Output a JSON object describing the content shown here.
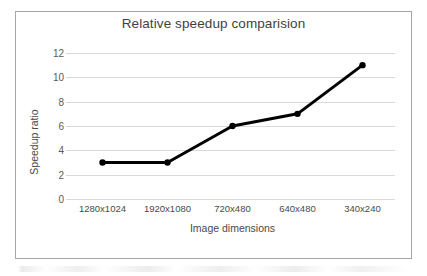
{
  "chart_data": {
    "type": "line",
    "title": "Relative speedup comparision",
    "xlabel": "Image dimensions",
    "ylabel": "Speedup ratio",
    "categories": [
      "1280x1024",
      "1920x1080",
      "720x480",
      "640x480",
      "340x240"
    ],
    "values": [
      3,
      3,
      6,
      7,
      11
    ],
    "series": [
      {
        "name": "Speedup ratio",
        "values": [
          3,
          3,
          6,
          7,
          11
        ]
      }
    ],
    "ylim": [
      0,
      12
    ],
    "y_ticks": [
      0,
      2,
      4,
      6,
      8,
      10,
      12
    ],
    "y_tick_labels": [
      "0",
      "2",
      "4",
      "6",
      "8",
      "10",
      "12"
    ],
    "grid": "horizontal",
    "legend": "none",
    "marker": "circle",
    "line_color": "#000000",
    "marker_color": "#000000",
    "gridline_color": "#d9d9d9",
    "plot_background": "#ffffff",
    "border_color": "#a6a6a6"
  }
}
